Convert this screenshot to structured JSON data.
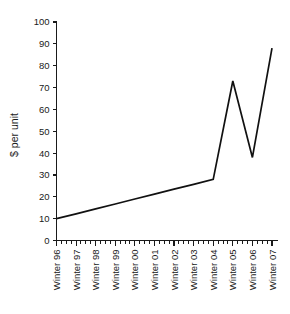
{
  "chart_data": {
    "type": "line",
    "title": "",
    "subtitle": "",
    "xlabel": "",
    "ylabel": "$ per unit",
    "categories": [
      "Winter 96",
      "Winter 97",
      "Winter 98",
      "Winter 99",
      "Winter 00",
      "Winter 01",
      "Winter 02",
      "Winter 03",
      "Winter 04",
      "Winter 05",
      "Winter 06",
      "Winter 07"
    ],
    "values": [
      10,
      12.2,
      14.5,
      16.7,
      19,
      21.2,
      23.5,
      25.7,
      28,
      73,
      38,
      88
    ],
    "series": [
      {
        "name": "$ per unit",
        "values": [
          10,
          12.2,
          14.5,
          16.7,
          19,
          21.2,
          23.5,
          25.7,
          28,
          73,
          38,
          88
        ],
        "color": "#111111"
      }
    ],
    "ylim": [
      0,
      100
    ],
    "yticks": [
      0,
      10,
      20,
      30,
      40,
      50,
      60,
      70,
      80,
      90,
      100
    ],
    "ytick_labels": [
      "0",
      "10",
      "20",
      "30",
      "40",
      "50",
      "60",
      "70",
      "80",
      "90",
      "100"
    ],
    "xlim": [
      0,
      11
    ],
    "grid": false,
    "legend": false,
    "legend_position": "none",
    "line_color": "#111111",
    "axis_color": "#1a1a1a",
    "background": "#ffffff",
    "x_minor_ticks_per_interval": 3,
    "annotations": []
  }
}
